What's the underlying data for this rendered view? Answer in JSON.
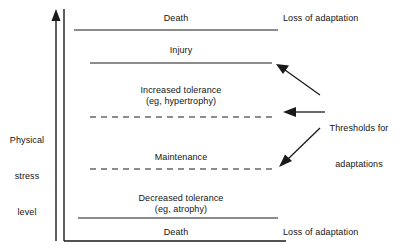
{
  "figure": {
    "type": "conceptual-diagram",
    "title_visible": false,
    "background_color": "#ffffff",
    "line_color": "#1a1a1a",
    "axis": {
      "label_lines": [
        "Physical",
        "stress",
        "level"
      ],
      "direction": "up",
      "arrow_icon": "up-arrow-icon",
      "has_vertical_axis_line": true,
      "has_baseline": true
    },
    "bands": [
      {
        "id": "death-top",
        "label": "Death",
        "sublabel": "",
        "right_note": "Loss of adaptation",
        "boundary_style": "solid",
        "boundary_position": "below"
      },
      {
        "id": "injury",
        "label": "Injury",
        "sublabel": "",
        "right_note": "",
        "boundary_style": "solid",
        "boundary_position": "below"
      },
      {
        "id": "increased-tolerance",
        "label": "Increased tolerance",
        "sublabel": "(eg, hypertrophy)",
        "right_note": "",
        "boundary_style": "dashed",
        "boundary_position": "below"
      },
      {
        "id": "maintenance",
        "label": "Maintenance",
        "sublabel": "",
        "right_note": "",
        "boundary_style": "dashed",
        "boundary_position": "below"
      },
      {
        "id": "decreased-tolerance",
        "label": "Decreased tolerance",
        "sublabel": "(eg, atrophy)",
        "right_note": "",
        "boundary_style": "solid",
        "boundary_position": "below"
      },
      {
        "id": "death-bottom",
        "label": "Death",
        "sublabel": "",
        "right_note": "Loss of adaptation",
        "boundary_style": "solid",
        "boundary_position": "below"
      }
    ],
    "callout": {
      "lines": [
        "Thresholds for",
        "adaptations"
      ],
      "line1": "Thresholds for",
      "line2": "adaptations",
      "arrow_count": 3,
      "arrow_targets": [
        "injury",
        "increased-tolerance",
        "maintenance"
      ]
    }
  }
}
